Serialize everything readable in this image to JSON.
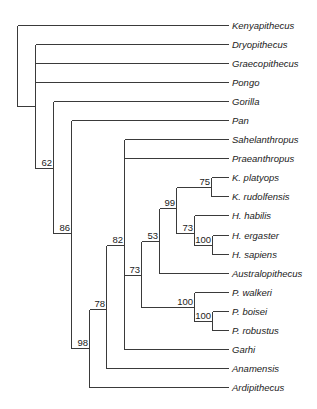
{
  "diagram": {
    "type": "cladogram",
    "line_color": "#3a3a3a",
    "text_color": "#222222",
    "leaf_end_x": 228,
    "label_x": 232,
    "taxa": [
      {
        "name": "Kenyapithecus",
        "y": 25
      },
      {
        "name": "Dryopithecus",
        "y": 44
      },
      {
        "name": "Graecopithecus",
        "y": 63
      },
      {
        "name": "Pongo",
        "y": 82
      },
      {
        "name": "Gorilla",
        "y": 101
      },
      {
        "name": "Pan",
        "y": 120
      },
      {
        "name": "Sahelanthropus",
        "y": 139
      },
      {
        "name": "Praeanthropus",
        "y": 158
      },
      {
        "name": "K. platyops",
        "y": 177
      },
      {
        "name": "K. rudolfensis",
        "y": 196
      },
      {
        "name": "H. habilis",
        "y": 215
      },
      {
        "name": "H. ergaster",
        "y": 235
      },
      {
        "name": "H. sapiens",
        "y": 254
      },
      {
        "name": "Australopithecus",
        "y": 273
      },
      {
        "name": "P. walkeri",
        "y": 292
      },
      {
        "name": "P. boisei",
        "y": 311
      },
      {
        "name": "P. robustus",
        "y": 330
      },
      {
        "name": "Garhi",
        "y": 349
      },
      {
        "name": "Anamensis",
        "y": 368
      },
      {
        "name": "Ardipithecus",
        "y": 387
      }
    ],
    "leaf_attach": [
      {
        "taxon": "Kenyapithecus",
        "x": 17
      },
      {
        "taxon": "Dryopithecus",
        "x": 35
      },
      {
        "taxon": "Graecopithecus",
        "x": 35
      },
      {
        "taxon": "Pongo",
        "x": 35
      },
      {
        "taxon": "Gorilla",
        "x": 53
      },
      {
        "taxon": "Pan",
        "x": 71
      },
      {
        "taxon": "Sahelanthropus",
        "x": 124
      },
      {
        "taxon": "Praeanthropus",
        "x": 124
      },
      {
        "taxon": "K. platyops",
        "x": 211
      },
      {
        "taxon": "K. rudolfensis",
        "x": 211
      },
      {
        "taxon": "H. habilis",
        "x": 194
      },
      {
        "taxon": "H. ergaster",
        "x": 212
      },
      {
        "taxon": "H. sapiens",
        "x": 212
      },
      {
        "taxon": "Australopithecus",
        "x": 159
      },
      {
        "taxon": "P. walkeri",
        "x": 194
      },
      {
        "taxon": "P. boisei",
        "x": 212
      },
      {
        "taxon": "P. robustus",
        "x": 212
      },
      {
        "taxon": "Garhi",
        "x": 124
      },
      {
        "taxon": "Anamensis",
        "x": 106
      },
      {
        "taxon": "Ardipithecus",
        "x": 89
      }
    ],
    "nodes": [
      {
        "id": "root",
        "x": 17,
        "y_top": 25,
        "y_bottom": 106,
        "support": null,
        "parent_x": null,
        "y": 106
      },
      {
        "id": "n_great_apes",
        "x": 35,
        "y_top": 44,
        "y_bottom": 168,
        "support": null,
        "parent_x": 17,
        "y": 106
      },
      {
        "id": "n62",
        "x": 53,
        "y_top": 101,
        "y_bottom": 233,
        "support": "62",
        "parent_x": 35,
        "y": 168
      },
      {
        "id": "n86",
        "x": 71,
        "y_top": 120,
        "y_bottom": 348,
        "support": "86",
        "parent_x": 53,
        "y": 233
      },
      {
        "id": "n98",
        "x": 89,
        "y_top": 309,
        "y_bottom": 387,
        "support": "98",
        "parent_x": 71,
        "y": 348
      },
      {
        "id": "n78",
        "x": 106,
        "y_top": 245,
        "y_bottom": 368,
        "support": "78",
        "parent_x": 89,
        "y": 309
      },
      {
        "id": "n82",
        "x": 124,
        "y_top": 139,
        "y_bottom": 349,
        "support": "82",
        "parent_x": 106,
        "y": 245
      },
      {
        "id": "n73a",
        "x": 141,
        "y_top": 241,
        "y_bottom": 307,
        "support": "73",
        "parent_x": 124,
        "y": 275
      },
      {
        "id": "n53",
        "x": 159,
        "y_top": 208,
        "y_bottom": 273,
        "support": "53",
        "parent_x": 141,
        "y": 241
      },
      {
        "id": "n99",
        "x": 176,
        "y_top": 187,
        "y_bottom": 233,
        "support": "99",
        "parent_x": 159,
        "y": 208
      },
      {
        "id": "n75",
        "x": 211,
        "y_top": 177,
        "y_bottom": 196,
        "support": "75",
        "parent_x": 176,
        "y": 187
      },
      {
        "id": "n73b",
        "x": 194,
        "y_top": 215,
        "y_bottom": 245,
        "support": "73",
        "parent_x": 176,
        "y": 233
      },
      {
        "id": "n100a",
        "x": 212,
        "y_top": 235,
        "y_bottom": 254,
        "support": "100",
        "parent_x": 194,
        "y": 245
      },
      {
        "id": "n100b",
        "x": 194,
        "y_top": 292,
        "y_bottom": 321,
        "support": "100",
        "parent_x": 141,
        "y": 307
      },
      {
        "id": "n100c",
        "x": 212,
        "y_top": 311,
        "y_bottom": 330,
        "support": "100",
        "parent_x": 194,
        "y": 321
      }
    ]
  }
}
